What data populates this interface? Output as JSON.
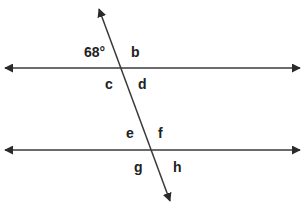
{
  "diagram": {
    "type": "parallel-lines-transversal",
    "line_color": "#3a3a3a",
    "lines": {
      "parallel_top": {
        "y": 68,
        "x1": 4,
        "x2": 301,
        "arrows": "both"
      },
      "parallel_bottom": {
        "y": 150,
        "x1": 4,
        "x2": 301,
        "arrows": "both"
      },
      "transversal": {
        "x1": 99,
        "y1": 8,
        "x2": 171,
        "y2": 202,
        "arrows": "both"
      }
    },
    "labels": {
      "given_angle": "68°",
      "b": "b",
      "c": "c",
      "d": "d",
      "e": "e",
      "f": "f",
      "g": "g",
      "h": "h"
    }
  }
}
